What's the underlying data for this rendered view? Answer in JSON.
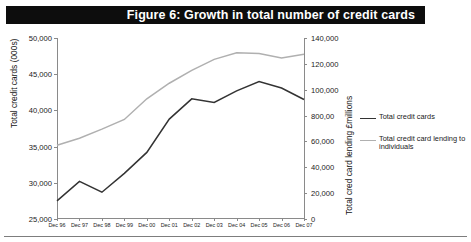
{
  "figure": {
    "title": "Figure 6: Growth in total number of credit cards",
    "banner_color": "#0d0d0d",
    "banner_text_color": "#ffffff"
  },
  "chart_data": {
    "type": "line",
    "title": "Figure 6: Growth in total number of credit cards",
    "xlabel": "",
    "x": [
      "Dec 96",
      "Dec 97",
      "Dec 98",
      "Dec 99",
      "Dec 00",
      "Dec 01",
      "Dec 02",
      "Dec 03",
      "Dec 04",
      "Dec 05",
      "Dec 06",
      "Dec 07"
    ],
    "grid": false,
    "legend_position": "right",
    "axes": {
      "left": {
        "label": "Total credit cards (000s)",
        "ylim": [
          25000,
          50000
        ],
        "ticks": [
          25000,
          30000,
          35000,
          40000,
          45000,
          50000
        ],
        "ticklabels": [
          "25,000",
          "30,000",
          "35,000",
          "40,000",
          "45,000",
          "50,000"
        ]
      },
      "right": {
        "label": "Total cred card lending £millions",
        "ylim": [
          0,
          140000
        ],
        "ticks": [
          0,
          20000,
          40000,
          60000,
          80000,
          100000,
          120000,
          140000
        ],
        "ticklabels": [
          "0",
          "20,000",
          "40,000",
          "60,000",
          "800,00",
          "100,000",
          "120,000",
          "140,000"
        ]
      }
    },
    "series": [
      {
        "name": "Total credit cards",
        "axis": "left",
        "color": "#333333",
        "values": [
          27500,
          30200,
          28700,
          31300,
          34200,
          38800,
          41600,
          41100,
          42700,
          44000,
          43100,
          41500
        ]
      },
      {
        "name": "Total credit card lending to individuals",
        "axis": "right",
        "color": "#b0b0b0",
        "values": [
          57000,
          62500,
          69500,
          77000,
          93000,
          105000,
          115000,
          123500,
          128500,
          128000,
          124500,
          127500
        ]
      }
    ]
  },
  "legend": {
    "items": [
      {
        "label": "Total credit cards",
        "color": "#333333"
      },
      {
        "label": "Total credit card lending to individuals",
        "color": "#b0b0b0"
      }
    ]
  }
}
